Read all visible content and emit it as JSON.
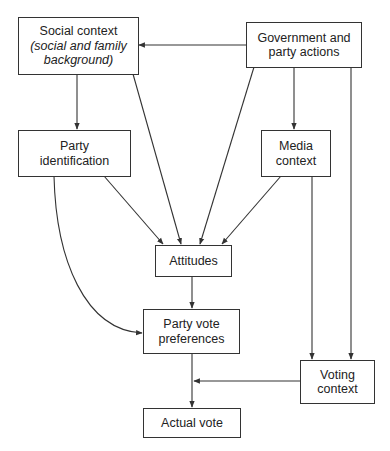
{
  "diagram": {
    "type": "flowchart",
    "nodes": {
      "social_context": {
        "title": "Social context",
        "subtitle": "(social and family",
        "subtitle2": "background)"
      },
      "government": {
        "line1": "Government and",
        "line2": "party actions"
      },
      "party_identification": {
        "line1": "Party",
        "line2": "identification"
      },
      "media_context": {
        "line1": "Media",
        "line2": "context"
      },
      "attitudes": {
        "line1": "Attitudes"
      },
      "party_vote_preferences": {
        "line1": "Party vote",
        "line2": "preferences"
      },
      "voting_context": {
        "line1": "Voting",
        "line2": "context"
      },
      "actual_vote": {
        "line1": "Actual vote"
      }
    },
    "edges": [
      {
        "from": "Government and party actions",
        "to": "Social context"
      },
      {
        "from": "Government and party actions",
        "to": "Attitudes"
      },
      {
        "from": "Government and party actions",
        "to": "Media context"
      },
      {
        "from": "Government and party actions",
        "to": "Voting context"
      },
      {
        "from": "Social context",
        "to": "Party identification"
      },
      {
        "from": "Social context",
        "to": "Attitudes"
      },
      {
        "from": "Party identification",
        "to": "Attitudes"
      },
      {
        "from": "Party identification",
        "to": "Party vote preferences"
      },
      {
        "from": "Media context",
        "to": "Attitudes"
      },
      {
        "from": "Media context",
        "to": "Voting context"
      },
      {
        "from": "Attitudes",
        "to": "Party vote preferences"
      },
      {
        "from": "Party vote preferences",
        "to": "Actual vote"
      },
      {
        "from": "Voting context",
        "to": "Actual vote"
      }
    ],
    "colors": {
      "line": "#333333",
      "box_border": "#333333",
      "background": "#ffffff"
    }
  }
}
